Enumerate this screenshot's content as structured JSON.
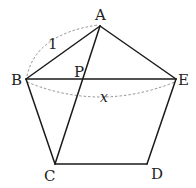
{
  "diagram": {
    "type": "regular pentagon with diagonals",
    "points": {
      "A": {
        "label": "A",
        "x": 100,
        "y": 26
      },
      "B": {
        "label": "B",
        "x": 26,
        "y": 79
      },
      "C": {
        "label": "C",
        "x": 55,
        "y": 164
      },
      "D": {
        "label": "D",
        "x": 147,
        "y": 164
      },
      "E": {
        "label": "E",
        "x": 176,
        "y": 79
      },
      "P": {
        "label": "P",
        "x": 83,
        "y": 79
      }
    },
    "segments": [
      "AB",
      "AE",
      "BC",
      "CD",
      "DE",
      "BE",
      "AC"
    ],
    "intersection": "P = AC ∩ BE",
    "measures": {
      "AB": {
        "label": "1"
      },
      "BE": {
        "label": "x"
      }
    },
    "colors": {
      "line": "#1a1a1a",
      "dashed_arc": "#777777",
      "text": "#222222"
    }
  }
}
